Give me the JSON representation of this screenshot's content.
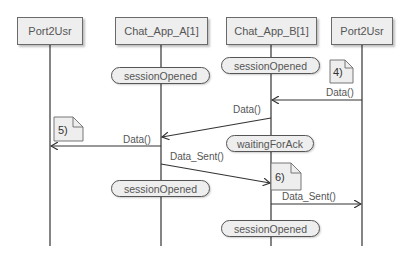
{
  "diagram": {
    "type": "sequence",
    "participants": [
      {
        "name": "Port2Usr"
      },
      {
        "name": "Chat_App_A[1]"
      },
      {
        "name": "Chat_App_B[1]"
      },
      {
        "name": "Port2Usr"
      }
    ],
    "states": [
      {
        "owner": "Chat_App_A[1]",
        "label": "sessionOpened"
      },
      {
        "owner": "Chat_App_B[1]",
        "label": "sessionOpened"
      },
      {
        "owner": "Chat_App_B[1]",
        "label": "waitingForAck"
      },
      {
        "owner": "Chat_App_A[1]",
        "label": "sessionOpened"
      },
      {
        "owner": "Chat_App_B[1]",
        "label": "sessionOpened"
      }
    ],
    "notes": [
      {
        "label": "4)"
      },
      {
        "label": "5)"
      },
      {
        "label": "6)"
      }
    ],
    "messages": [
      {
        "from": "Port2Usr",
        "to": "Chat_App_B[1]",
        "label": "Data()"
      },
      {
        "from": "Chat_App_B[1]",
        "to": "Chat_App_A[1]",
        "label": "Data()"
      },
      {
        "from": "Chat_App_A[1]",
        "to": "Port2Usr",
        "label": "Data()"
      },
      {
        "from": "Chat_App_A[1]",
        "to": "Chat_App_B[1]",
        "label": "Data_Sent()"
      },
      {
        "from": "Chat_App_B[1]",
        "to": "Port2Usr",
        "label": "Data_Sent()"
      }
    ]
  },
  "colors": {
    "box_fill": "#eeeeee",
    "border": "#555555",
    "line": "#333333",
    "text": "#555555"
  }
}
